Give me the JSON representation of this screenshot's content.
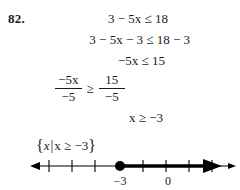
{
  "problem": {
    "number": "82."
  },
  "steps": [
    {
      "id": "step1",
      "text": "3 − 5x ≤ 18"
    },
    {
      "id": "step2",
      "text": "3 − 5x − 3 ≤ 18 − 3"
    },
    {
      "id": "step3",
      "text": "−5x ≤ 15"
    },
    {
      "id": "step4",
      "type": "fraction",
      "left_numerator": "−5x",
      "left_denominator": "−5",
      "relation": "≥",
      "right_numerator": "15",
      "right_denominator": "−5"
    },
    {
      "id": "step5",
      "text": "x ≥ −3"
    }
  ],
  "solution_set": {
    "open_brace": "{",
    "variable": "x",
    "separator": "|",
    "condition": "x ≥ −3",
    "close_brace": "}"
  },
  "number_line": {
    "point_value": "−3",
    "point_type": "closed",
    "direction": "right",
    "labels": [
      {
        "text": "−3",
        "x": 120
      },
      {
        "text": "0",
        "x": 168
      }
    ],
    "tick_positions": [
      49,
      72,
      95,
      118,
      143,
      166,
      189,
      212
    ],
    "axis_color": "#000000"
  }
}
